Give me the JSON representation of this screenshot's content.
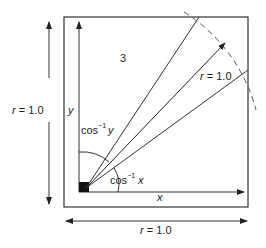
{
  "diagram": {
    "region_label": "3",
    "radius_label_diag": "r = 1.0",
    "radius_label_left": "r = 1.0",
    "radius_label_bottom": "r = 1.0",
    "axis_x": "x",
    "axis_y": "y",
    "angle_y": {
      "func": "cos",
      "exp": "−1",
      "var": "y"
    },
    "angle_x": {
      "func": "cos",
      "exp": "−1",
      "var": "x"
    },
    "colors": {
      "line": "#333333",
      "dash": "#666666",
      "fill": "#111111"
    }
  }
}
